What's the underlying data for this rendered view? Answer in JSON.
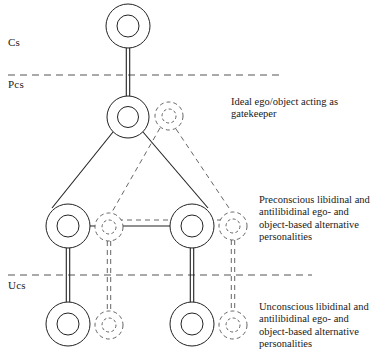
{
  "figure": {
    "title": "",
    "background_color": "#ffffff",
    "stroke_color": "#222222",
    "dash_color": "#555555"
  },
  "layer_labels": [
    {
      "id": "cs",
      "text": "Cs",
      "x": 8,
      "y": 36
    },
    {
      "id": "pcs",
      "text": "Pcs",
      "x": 8,
      "y": 78
    },
    {
      "id": "ucs",
      "text": "Ucs",
      "x": 8,
      "y": 279
    }
  ],
  "dividers": [
    {
      "id": "cs-pcs-divider",
      "y": 75,
      "x1": 8,
      "x2": 282
    },
    {
      "id": "pcs-ucs-divider",
      "y": 275,
      "x1": 8,
      "x2": 312
    }
  ],
  "annotations": [
    {
      "id": "gatekeeper",
      "text": "Ideal ego/object acting as\ngatekeeper",
      "x": 231,
      "y": 96
    },
    {
      "id": "preconscious",
      "text": "Preconscious libidinal and\nantilibidinal ego- and\nobject-based alternative\npersonalities",
      "x": 259,
      "y": 194
    },
    {
      "id": "unconscious",
      "text": "Unconscious libidinal and\nantilibidinal ego- and\nobject-based alternative\npersonalities",
      "x": 259,
      "y": 301
    }
  ],
  "nodes": [
    {
      "id": "central-ego",
      "style": "solid",
      "cx": 128,
      "cy": 26,
      "r_outer": 22,
      "r_inner": 11
    },
    {
      "id": "ideal-ego-object",
      "style": "solid",
      "cx": 128,
      "cy": 117,
      "r_outer": 21,
      "r_inner": 10.5
    },
    {
      "id": "ideal-ego-shadow",
      "style": "dashed",
      "cx": 169,
      "cy": 116,
      "r_outer": 14,
      "r_inner": 7
    },
    {
      "id": "pcs-left-ego",
      "style": "solid",
      "cx": 68,
      "cy": 226,
      "r_outer": 22,
      "r_inner": 11
    },
    {
      "id": "pcs-left-shadow",
      "style": "dashed",
      "cx": 109,
      "cy": 227,
      "r_outer": 14,
      "r_inner": 7
    },
    {
      "id": "pcs-right-ego",
      "style": "solid",
      "cx": 192,
      "cy": 226,
      "r_outer": 22,
      "r_inner": 11
    },
    {
      "id": "pcs-right-shadow",
      "style": "dashed",
      "cx": 233,
      "cy": 226,
      "r_outer": 14,
      "r_inner": 7
    },
    {
      "id": "ucs-left-ego",
      "style": "solid",
      "cx": 68,
      "cy": 324,
      "r_outer": 22,
      "r_inner": 11
    },
    {
      "id": "ucs-left-shadow",
      "style": "dashed",
      "cx": 109,
      "cy": 325,
      "r_outer": 14,
      "r_inner": 7
    },
    {
      "id": "ucs-right-ego",
      "style": "solid",
      "cx": 192,
      "cy": 324,
      "r_outer": 22,
      "r_inner": 11
    },
    {
      "id": "ucs-right-shadow",
      "style": "dashed",
      "cx": 233,
      "cy": 325,
      "r_outer": 14,
      "r_inner": 7
    }
  ],
  "edges": [
    {
      "id": "edge-cs-to-pcs",
      "style": "double-solid",
      "x1": 128,
      "y1": 48,
      "x2": 128,
      "y2": 96
    },
    {
      "id": "edge-pcs-to-left",
      "style": "solid",
      "x1": 113,
      "y1": 132,
      "x2": 52,
      "y2": 208
    },
    {
      "id": "edge-pcs-to-right",
      "style": "solid",
      "x1": 143,
      "y1": 132,
      "x2": 208,
      "y2": 208
    },
    {
      "id": "edge-pcs-left-to-right",
      "style": "solid",
      "x1": 90,
      "y1": 226,
      "x2": 170,
      "y2": 226
    },
    {
      "id": "edge-shadow-to-left-shadow",
      "style": "dashed",
      "x1": 160,
      "y1": 128,
      "x2": 112,
      "y2": 212
    },
    {
      "id": "edge-shadow-to-right-shadow",
      "style": "dashed",
      "x1": 176,
      "y1": 129,
      "x2": 231,
      "y2": 211
    },
    {
      "id": "edge-shadow-left-to-right",
      "style": "dashed",
      "x1": 100,
      "y1": 220,
      "x2": 223,
      "y2": 220
    },
    {
      "id": "edge-left-pcs-to-ucs",
      "style": "double-solid",
      "x1": 68,
      "y1": 248,
      "x2": 68,
      "y2": 302
    },
    {
      "id": "edge-right-pcs-to-ucs",
      "style": "double-solid",
      "x1": 192,
      "y1": 248,
      "x2": 192,
      "y2": 302
    },
    {
      "id": "edge-left-shadow-vertical",
      "style": "double-dashed",
      "x1": 109,
      "y1": 241,
      "x2": 109,
      "y2": 311
    },
    {
      "id": "edge-right-shadow-vertical",
      "style": "double-dashed",
      "x1": 233,
      "y1": 240,
      "x2": 233,
      "y2": 311
    }
  ]
}
